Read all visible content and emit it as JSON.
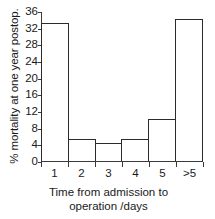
{
  "chart_data": {
    "type": "bar",
    "title": "",
    "categories": [
      "1",
      "2",
      "3",
      "4",
      "5",
      ">5"
    ],
    "values": [
      33.3,
      5.3,
      4.3,
      5.3,
      10.0,
      34.3
    ],
    "xlabel": "Time from admission to operation /days",
    "xlabel_line1": "Time from admission to",
    "xlabel_line2": "operation /days",
    "ylabel": "% mortality at one year postop.",
    "ylim": [
      0,
      36
    ],
    "xlim_note": "categorical histogram bins, contiguous bars",
    "yticks": [
      0,
      4,
      8,
      12,
      16,
      20,
      24,
      28,
      32,
      36
    ],
    "ytick_labels": [
      "0",
      "4",
      "8",
      "12",
      "16",
      "20",
      "24",
      "28",
      "32",
      "36"
    ],
    "grid": false,
    "legend": false,
    "legend_position": "none",
    "bar_fill_color": "#ffffff",
    "bar_edge_color": "#2b2b2b",
    "axis_color": "#3a3a3a",
    "text_color": "#1a1a1a",
    "background_color": "#ffffff"
  }
}
